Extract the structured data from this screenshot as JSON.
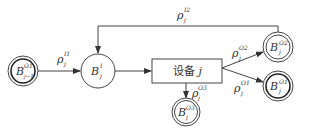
{
  "diagram": {
    "type": "flow-diagram",
    "nodes": [
      {
        "id": "b_prev_o1",
        "base": "B",
        "sup": "O1",
        "sub": "j−1",
        "style": "double-bold"
      },
      {
        "id": "b_in",
        "base": "B",
        "sup": "I",
        "sub": "j",
        "style": "single"
      },
      {
        "id": "device",
        "label": "设备 ",
        "var": "j",
        "style": "box"
      },
      {
        "id": "b_o3",
        "base": "B",
        "sup": "O3",
        "sub": "j",
        "style": "double"
      },
      {
        "id": "b_o2",
        "base": "B",
        "sup": "O2",
        "sub": "j",
        "style": "double"
      },
      {
        "id": "b_o1",
        "base": "B",
        "sup": "O1",
        "sub": "j",
        "style": "double-bold"
      }
    ],
    "edges": [
      {
        "from": "b_prev_o1",
        "to": "b_in",
        "base": "ρ",
        "sup": "I1",
        "sub": "j"
      },
      {
        "from": "b_in",
        "to": "device",
        "base": "",
        "sup": "",
        "sub": ""
      },
      {
        "from": "device",
        "to": "b_o3",
        "base": "ρ",
        "sup": "O3",
        "sub": "j"
      },
      {
        "from": "device",
        "to": "b_o2",
        "base": "ρ",
        "sup": "O2",
        "sub": "j"
      },
      {
        "from": "device",
        "to": "b_o1",
        "base": "ρ",
        "sup": "O1",
        "sub": "j"
      },
      {
        "from": "b_o2",
        "to": "b_in",
        "base": "ρ",
        "sup": "I2",
        "sub": "j"
      }
    ]
  }
}
